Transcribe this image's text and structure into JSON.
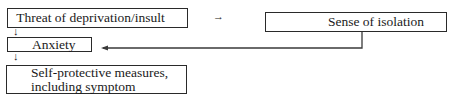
{
  "diagram": {
    "nodes": [
      {
        "id": "threat",
        "label": "Threat of deprivation/insult"
      },
      {
        "id": "isolation",
        "label": "Sense of isolation"
      },
      {
        "id": "anxiety",
        "label": "Anxiety"
      },
      {
        "id": "self_protective",
        "label_line1": "Self-protective measures,",
        "label_line2": "including symptom"
      }
    ],
    "edges": [
      {
        "from": "threat",
        "to": "isolation",
        "glyph": "→"
      },
      {
        "from": "threat",
        "to": "anxiety",
        "glyph": "↓"
      },
      {
        "from": "isolation",
        "to": "anxiety"
      },
      {
        "from": "anxiety",
        "to": "self_protective",
        "glyph": "↓"
      }
    ]
  }
}
